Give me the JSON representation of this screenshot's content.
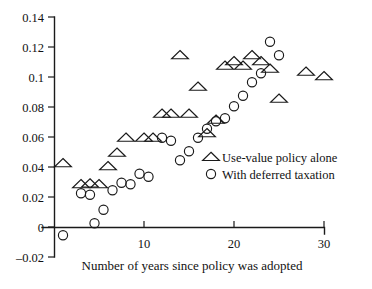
{
  "chart_data": {
    "type": "scatter",
    "title": "",
    "subtitle": "",
    "xlabel": "Number of years since policy was adopted",
    "ylabel": "",
    "xlim": [
      -1.5,
      33
    ],
    "ylim": [
      -0.02,
      0.14
    ],
    "grid": false,
    "legend_position": "center-right",
    "xticks": [
      10,
      20,
      30
    ],
    "xtick_labels": [
      "10",
      "20",
      "30"
    ],
    "yticks": [
      -0.02,
      0,
      0.02,
      0.04,
      0.06,
      0.08,
      0.1,
      0.12,
      0.14
    ],
    "ytick_labels": [
      "-0.02",
      "0",
      "0.02",
      "0.04",
      "0.06",
      "0.08",
      "0.1",
      "0.12",
      "0.14"
    ],
    "annotations": [],
    "series": [
      {
        "name": "Use-value policy alone",
        "marker": "triangle",
        "color": "#1a1a1a",
        "points": [
          [
            1,
            0.0425
          ],
          [
            3,
            0.0285
          ],
          [
            4,
            0.029
          ],
          [
            5,
            0.0285
          ],
          [
            6,
            0.0405
          ],
          [
            8,
            0.0595
          ],
          [
            7,
            0.0495
          ],
          [
            10,
            0.0595
          ],
          [
            12,
            0.0755
          ],
          [
            13,
            0.0755
          ],
          [
            14,
            0.1145
          ],
          [
            15,
            0.0755
          ],
          [
            11,
            0.0595
          ],
          [
            16,
            0.0935
          ],
          [
            17,
            0.0625
          ],
          [
            18,
            0.0715
          ],
          [
            19,
            0.1075
          ],
          [
            20,
            0.1105
          ],
          [
            21,
            0.1075
          ],
          [
            22,
            0.1145
          ],
          [
            23,
            0.1105
          ],
          [
            24,
            0.1055
          ],
          [
            25,
            0.0855
          ],
          [
            28,
            0.1035
          ],
          [
            30,
            0.1005
          ]
        ]
      },
      {
        "name": "With deferred taxation",
        "marker": "circle",
        "color": "#1a1a1a",
        "points": [
          [
            1,
            -0.0055
          ],
          [
            3,
            0.0225
          ],
          [
            4,
            0.0215
          ],
          [
            4.5,
            0.0025
          ],
          [
            5.5,
            0.0115
          ],
          [
            6.5,
            0.0245
          ],
          [
            7.5,
            0.0295
          ],
          [
            8.5,
            0.0285
          ],
          [
            9.5,
            0.0355
          ],
          [
            10.5,
            0.0335
          ],
          [
            12,
            0.0595
          ],
          [
            13,
            0.0575
          ],
          [
            14,
            0.0445
          ],
          [
            15,
            0.0505
          ],
          [
            16,
            0.0595
          ],
          [
            17,
            0.0655
          ],
          [
            18,
            0.0705
          ],
          [
            19,
            0.0725
          ],
          [
            20,
            0.0805
          ],
          [
            21,
            0.0875
          ],
          [
            22,
            0.0965
          ],
          [
            23,
            0.1025
          ],
          [
            24,
            0.1235
          ],
          [
            25,
            0.1145
          ]
        ]
      }
    ]
  },
  "legend": {
    "entries": [
      {
        "label": "Use-value policy alone",
        "marker": "triangle-up-icon"
      },
      {
        "label": "With deferred taxation",
        "marker": "circle-icon"
      }
    ]
  }
}
